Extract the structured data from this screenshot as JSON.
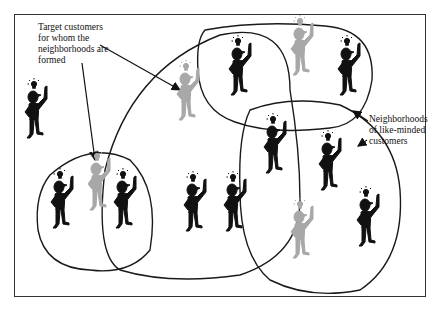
{
  "diagram": {
    "labels": {
      "target": "Target customers\nfor whom the\nneighborhoods are\nformed",
      "neighborhoods": "Neighborhoods\nof like-minded\ncustomers"
    },
    "colors": {
      "customer": "#111111",
      "target_customer": "#a8a8a8",
      "outline": "#1a1a1a",
      "frame": "#333333"
    },
    "figures": [
      {
        "id": "f1",
        "type": "customer",
        "x": 34,
        "y": 100
      },
      {
        "id": "f2",
        "type": "target",
        "x": 97,
        "y": 172
      },
      {
        "id": "f3",
        "type": "customer",
        "x": 60,
        "y": 190
      },
      {
        "id": "f4",
        "type": "customer",
        "x": 123,
        "y": 190
      },
      {
        "id": "f5",
        "type": "target",
        "x": 186,
        "y": 82
      },
      {
        "id": "f6",
        "type": "customer",
        "x": 193,
        "y": 193
      },
      {
        "id": "f7",
        "type": "customer",
        "x": 233,
        "y": 193
      },
      {
        "id": "f8",
        "type": "customer",
        "x": 238,
        "y": 57
      },
      {
        "id": "f9",
        "type": "target",
        "x": 300,
        "y": 37
      },
      {
        "id": "f10",
        "type": "customer",
        "x": 347,
        "y": 57
      },
      {
        "id": "f11",
        "type": "customer",
        "x": 273,
        "y": 135
      },
      {
        "id": "f12",
        "type": "customer",
        "x": 328,
        "y": 152
      },
      {
        "id": "f13",
        "type": "target",
        "x": 300,
        "y": 220
      },
      {
        "id": "f14",
        "type": "customer",
        "x": 366,
        "y": 208
      }
    ]
  }
}
